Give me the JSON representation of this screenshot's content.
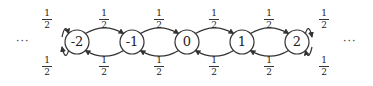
{
  "diagram": {
    "type": "markov-chain-random-walk",
    "left_ellipsis": "···",
    "right_ellipsis": "···",
    "nodes": [
      {
        "label": "-2",
        "x": 77
      },
      {
        "label": "-1",
        "x": 132
      },
      {
        "label": "0",
        "x": 187
      },
      {
        "label": "1",
        "x": 242
      },
      {
        "label": "2",
        "x": 297
      }
    ],
    "node_y": 42,
    "node_radius": 12,
    "top_labels": [
      {
        "num": "1",
        "den": "2",
        "x": 47
      },
      {
        "num": "1",
        "den": "2",
        "x": 104
      },
      {
        "num": "1",
        "den": "2",
        "x": 159
      },
      {
        "num": "1",
        "den": "2",
        "x": 214
      },
      {
        "num": "1",
        "den": "2",
        "x": 269
      },
      {
        "num": "1",
        "den": "2",
        "x": 324
      }
    ],
    "bottom_labels": [
      {
        "num": "1",
        "den": "2",
        "x": 47
      },
      {
        "num": "1",
        "den": "2",
        "x": 104
      },
      {
        "num": "1",
        "den": "2",
        "x": 159
      },
      {
        "num": "1",
        "den": "2",
        "x": 214
      },
      {
        "num": "1",
        "den": "2",
        "x": 269
      },
      {
        "num": "1",
        "den": "2",
        "x": 324
      }
    ],
    "stroke_color": "#333333"
  }
}
